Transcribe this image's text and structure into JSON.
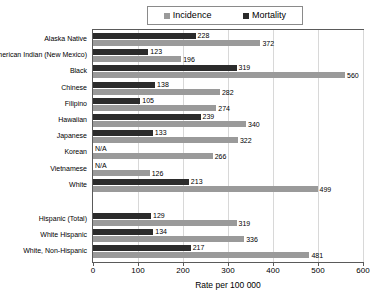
{
  "chart_data": {
    "type": "bar",
    "orientation": "horizontal",
    "title": "",
    "xlabel": "Rate per 100 000",
    "ylabel": "",
    "xlim": [
      0,
      600
    ],
    "xticks": [
      0,
      100,
      200,
      300,
      400,
      500,
      600
    ],
    "grid": true,
    "legend_position": "top",
    "categories": [
      "Alaska Native",
      "American Indian (New Mexico)",
      "Black",
      "Chinese",
      "Filipino",
      "Hawaiian",
      "Japanese",
      "Korean",
      "Vietnamese",
      "White",
      "Hispanic (Total)",
      "White Hispanic",
      "White, Non-Hispanic"
    ],
    "series": [
      {
        "name": "Mortality",
        "color": "#2b2b2b",
        "values": [
          228,
          123,
          319,
          138,
          105,
          239,
          133,
          null,
          null,
          213,
          129,
          134,
          217
        ],
        "labels": [
          "228",
          "123",
          "319",
          "138",
          "105",
          "239",
          "133",
          "N/A",
          "N/A",
          "213",
          "129",
          "134",
          "217"
        ]
      },
      {
        "name": "Incidence",
        "color": "#9a9a9a",
        "values": [
          372,
          196,
          560,
          282,
          274,
          340,
          322,
          266,
          126,
          499,
          319,
          336,
          481
        ],
        "labels": [
          "372",
          "196",
          "560",
          "282",
          "274",
          "340",
          "322",
          "266",
          "126",
          "499",
          "319",
          "336",
          "481"
        ]
      }
    ]
  },
  "legend": {
    "entries": [
      {
        "label": "Incidence",
        "color": "#9a9a9a"
      },
      {
        "label": "Mortality",
        "color": "#2b2b2b"
      }
    ]
  },
  "axis": {
    "x_title": "Rate per 100 000",
    "x_tick_labels": [
      "0",
      "100",
      "200",
      "300",
      "400",
      "500",
      "600"
    ]
  }
}
